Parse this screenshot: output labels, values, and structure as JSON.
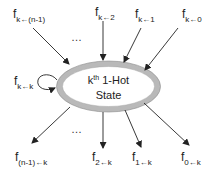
{
  "diagram": {
    "state": {
      "sup_prefix": "k",
      "sup": "th",
      "line1_rest": " 1-Hot",
      "line2": "State",
      "fill": "#ffffff",
      "ring_color": "#b8b8b8"
    },
    "incoming": [
      {
        "f": "f",
        "sub": "k←(n-1)"
      },
      {
        "f": "f",
        "sub": "k←2"
      },
      {
        "f": "f",
        "sub": "k←1"
      },
      {
        "f": "f",
        "sub": "k←0"
      }
    ],
    "self_loop": {
      "f": "f",
      "sub": "k←k"
    },
    "outgoing": [
      {
        "f": "f",
        "sub": "(n-1)←k"
      },
      {
        "f": "f",
        "sub": "2←k"
      },
      {
        "f": "f",
        "sub": "1←k"
      },
      {
        "f": "f",
        "sub": "0←k"
      }
    ],
    "ellipsis_top": "…",
    "ellipsis_bottom": "…"
  }
}
